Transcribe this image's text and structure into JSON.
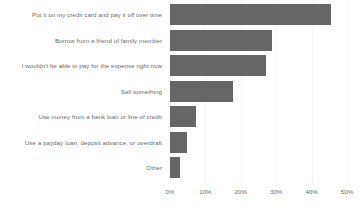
{
  "chart_data": {
    "type": "bar",
    "orientation": "horizontal",
    "title": "",
    "subtitle": "",
    "xlabel": "",
    "ylabel": "",
    "xlim": [
      0,
      50
    ],
    "grid": true,
    "legend": null,
    "bar_color": "#666667",
    "gridline_color": "#f4f4f5",
    "text_color": "#6b6b6b",
    "tick_labels": [
      "0%",
      "10%",
      "20%",
      "30%",
      "40%",
      "50%"
    ],
    "tick_values": [
      0,
      10,
      20,
      30,
      40,
      50
    ],
    "categories": [
      "Put it on my credit card and pay it off over time",
      "Borrow from a friend of family member",
      "I wouldn't be able to pay for the expense right now",
      "Sell something",
      "Use money from a bank loan or line of credit",
      "Use a payday loan, deposit advance, or overdraft",
      "Other"
    ],
    "values": [
      45.5,
      28.8,
      27.0,
      17.8,
      7.4,
      4.8,
      2.8
    ]
  }
}
